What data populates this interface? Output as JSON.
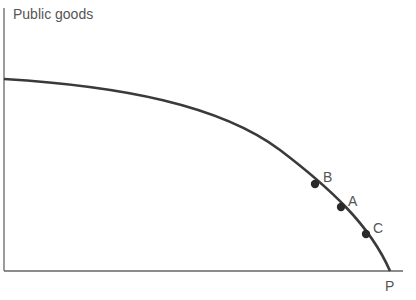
{
  "diagram": {
    "y_axis_label": "Public goods",
    "x_axis_end_label": "P",
    "curve": "production possibility frontier (concave)",
    "points": [
      {
        "label": "B",
        "x": 315,
        "y": 184
      },
      {
        "label": "A",
        "x": 341,
        "y": 207
      },
      {
        "label": "C",
        "x": 366,
        "y": 234
      }
    ],
    "colors": {
      "curve": "#3a3a3a",
      "axis": "#555555",
      "text": "#555555"
    }
  }
}
